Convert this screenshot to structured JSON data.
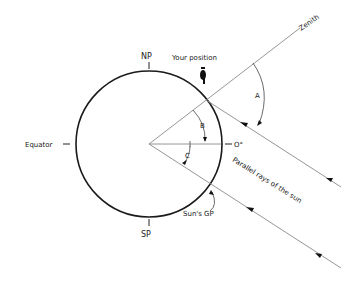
{
  "diagram": {
    "labels": {
      "north_pole": "NP",
      "south_pole": "SP",
      "equator": "Equator",
      "zero_degree": "O°",
      "zenith": "Zenith",
      "your_position": "Your position",
      "angle_a": "A",
      "angle_b": "B",
      "angle_c": "C",
      "sun_gp": "Sun's GP",
      "parallel_rays": "Parallel rays of the sun"
    },
    "colors": {
      "line": "#8a8a8a",
      "circle": "#1a1a1a",
      "text": "#222222"
    }
  }
}
